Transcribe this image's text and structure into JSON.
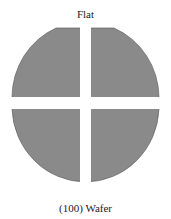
{
  "labels": {
    "top": "Flat",
    "bottom": "(100) Wafer"
  },
  "colors": {
    "fill": "#8a8a8a",
    "stroke": "#555555",
    "background": "#ffffff"
  },
  "wafer": {
    "quadrants": [
      "top-left",
      "top-right",
      "bottom-left",
      "bottom-right"
    ],
    "flat_position": "top"
  }
}
